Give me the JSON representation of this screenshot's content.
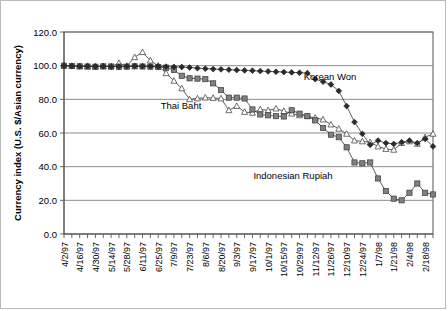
{
  "chart_data": {
    "type": "line",
    "title": "",
    "xlabel": "",
    "ylabel": "Currency index (U.S. $/Asian currency)",
    "ylim": [
      0,
      120
    ],
    "ytick_labels": [
      "0.0",
      "20.0",
      "40.0",
      "60.0",
      "80.0",
      "100.0",
      "120.0"
    ],
    "ytick_values": [
      0,
      20,
      40,
      60,
      80,
      100,
      120
    ],
    "grid": true,
    "legend_position": "inline-annotations",
    "x_tick_labels": [
      "4/2/97",
      "4/16/97",
      "4/30/97",
      "5/14/97",
      "5/28/97",
      "6/11/97",
      "6/25/97",
      "7/9/97",
      "7/23/97",
      "8/6/97",
      "8/20/97",
      "9/3/97",
      "9/17/97",
      "10/1/97",
      "10/15/97",
      "10/29/97",
      "11/12/97",
      "11/26/97",
      "12/10/97",
      "12/24/97",
      "1/7/98",
      "1/21/98",
      "2/4/98",
      "2/18/98"
    ],
    "x_tick_every_points": 2,
    "x": [
      "4/2/97",
      "4/9/97",
      "4/16/97",
      "4/23/97",
      "4/30/97",
      "5/7/97",
      "5/14/97",
      "5/21/97",
      "5/28/97",
      "6/4/97",
      "6/11/97",
      "6/18/97",
      "6/25/97",
      "7/2/97",
      "7/9/97",
      "7/16/97",
      "7/23/97",
      "7/30/97",
      "8/6/97",
      "8/13/97",
      "8/20/97",
      "8/27/97",
      "9/3/97",
      "9/10/97",
      "9/17/97",
      "9/24/97",
      "10/1/97",
      "10/8/97",
      "10/15/97",
      "10/22/97",
      "10/29/97",
      "11/5/97",
      "11/12/97",
      "11/19/97",
      "11/26/97",
      "12/3/97",
      "12/10/97",
      "12/17/97",
      "12/24/97",
      "12/31/97",
      "1/7/98",
      "1/14/98",
      "1/21/98",
      "1/28/98",
      "2/4/98",
      "2/11/98",
      "2/18/98",
      "2/25/98"
    ],
    "series": [
      {
        "name": "Korean Won",
        "marker": "diamond",
        "values": [
          100.0,
          99.8,
          99.6,
          99.7,
          99.5,
          99.6,
          99.4,
          99.5,
          99.6,
          99.8,
          99.7,
          99.6,
          99.5,
          99.4,
          99.3,
          99.2,
          98.9,
          98.5,
          98.2,
          98.0,
          97.8,
          97.6,
          97.4,
          97.2,
          97.0,
          96.8,
          96.6,
          96.4,
          96.2,
          96.0,
          95.8,
          95.6,
          92.0,
          90.5,
          88.8,
          85.0,
          76.0,
          66.5,
          59.5,
          53.0,
          55.5,
          54.0,
          53.5,
          54.5,
          55.5,
          54.0,
          56.5,
          52.0
        ]
      },
      {
        "name": "Indonesian Rupiah",
        "marker": "square",
        "values": [
          100.0,
          99.8,
          99.6,
          99.5,
          99.4,
          99.6,
          99.5,
          99.3,
          99.4,
          99.6,
          99.5,
          99.4,
          99.2,
          98.8,
          97.5,
          94.0,
          92.5,
          92.3,
          92.0,
          89.5,
          85.5,
          81.0,
          81.0,
          80.5,
          74.0,
          71.0,
          70.5,
          70.0,
          69.8,
          73.5,
          71.5,
          70.0,
          67.5,
          63.0,
          59.0,
          57.5,
          51.5,
          42.5,
          42.0,
          42.5,
          33.0,
          25.5,
          21.0,
          20.0,
          24.5,
          30.0,
          24.5,
          23.5
        ]
      },
      {
        "name": "Thai Baht",
        "marker": "triangle",
        "values": [
          100.0,
          99.8,
          99.6,
          99.5,
          99.4,
          99.6,
          99.5,
          101.5,
          99.8,
          105.0,
          108.0,
          103.0,
          100.0,
          95.5,
          91.0,
          86.5,
          80.0,
          80.5,
          81.0,
          80.8,
          80.5,
          73.5,
          76.0,
          72.5,
          72.0,
          74.0,
          73.5,
          74.5,
          73.0,
          71.5,
          70.5,
          70.0,
          69.0,
          68.0,
          65.0,
          62.5,
          59.5,
          55.5,
          55.0,
          54.5,
          52.0,
          50.5,
          50.0,
          54.0,
          55.0,
          53.5,
          57.5,
          59.5
        ]
      }
    ],
    "annotations": [
      {
        "text": "Korean Won",
        "x_px": 329,
        "y_px": 79
      },
      {
        "text": "Thai Baht",
        "x_px": 180,
        "y_px": 108
      },
      {
        "text": "Indonesian Rupiah",
        "x_px": 292,
        "y_px": 178
      }
    ]
  }
}
